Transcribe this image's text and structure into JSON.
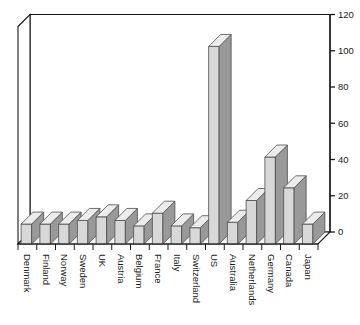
{
  "chart_data": {
    "type": "bar",
    "title": "",
    "subtitle": "",
    "xlabel": "",
    "ylabel": "",
    "ylim": [
      0,
      120
    ],
    "yticks": [
      0,
      20,
      40,
      60,
      80,
      100,
      120
    ],
    "grid": true,
    "legend": null,
    "legend_position": "none",
    "style": "3d-bar",
    "axis_position": "right",
    "tick_label_rotation": 90,
    "categories": [
      "Denmark",
      "Finland",
      "Norway",
      "Sweden",
      "UK",
      "Austria",
      "Belgium",
      "France",
      "Italy",
      "Switzerland",
      "US",
      "Australia",
      "Netherlands",
      "Germany",
      "Canada",
      "Japan"
    ],
    "values": [
      11,
      11,
      11,
      13,
      15,
      13,
      10,
      17,
      10,
      9,
      109,
      12,
      24,
      48,
      31,
      11
    ],
    "colors": {
      "bar_front": "#d8d8d8",
      "bar_side": "#999999",
      "bar_top": "#ececec",
      "bar_outline": "#4d4d4d",
      "axis": "#1a1a1a",
      "grid": "#808080",
      "floor": "#f2f2f2",
      "background": "#ffffff"
    }
  }
}
